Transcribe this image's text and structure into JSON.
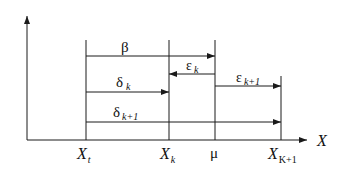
{
  "diagram": {
    "axis_x_label": "X",
    "ticks": {
      "xt": {
        "main": "X",
        "sub": "t"
      },
      "xk": {
        "main": "X",
        "sub": "k"
      },
      "mu": {
        "main": "μ"
      },
      "xk1": {
        "main": "X",
        "sub": "K+1"
      }
    },
    "arrows": {
      "beta": {
        "main": "β"
      },
      "delta_k": {
        "main": "δ",
        "sub": "k"
      },
      "delta_k1": {
        "main": "δ",
        "sub": "k+1"
      },
      "eps_k": {
        "main": "ε",
        "sub": "k"
      },
      "eps_k1": {
        "main": "ε",
        "sub": "k+1"
      }
    },
    "colors": {
      "line": "#1a1a1a",
      "background": "#ffffff"
    }
  }
}
